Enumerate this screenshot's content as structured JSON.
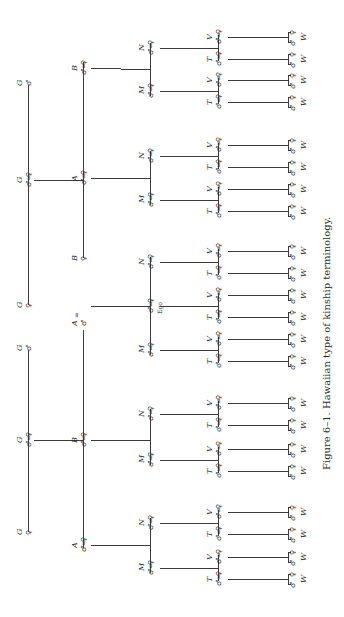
{
  "figure": {
    "caption": "Figure 6–1. Hawaiian type of kinship terminology.",
    "orientation": "rotated 90° clockwise",
    "symbols": {
      "male": "♂",
      "female": "♀",
      "married": "="
    },
    "ego_label": "Ego"
  },
  "generations": [
    {
      "level": "grandparents",
      "nodes": [
        {
          "label": "G",
          "sex": "male"
        },
        {
          "label": "G",
          "sex": "male",
          "spouse": {
            "label": "G",
            "sex": "female"
          }
        },
        {
          "label": "G",
          "sex": "female"
        },
        {
          "label": "G",
          "sex": "male"
        },
        {
          "label": "G",
          "sex": "male",
          "spouse": {
            "label": "G",
            "sex": "female"
          }
        },
        {
          "label": "G",
          "sex": "female"
        }
      ]
    },
    {
      "level": "parents",
      "nodes": [
        {
          "label": "B",
          "sex": "male",
          "spouse": {
            "label": "B",
            "sex": "female"
          }
        },
        {
          "label": "A",
          "sex": "male",
          "spouse": {
            "label": "A",
            "sex": "female"
          }
        },
        {
          "label": "B",
          "sex": "female"
        },
        {
          "label": "A",
          "sex": "male"
        },
        {
          "label": "B",
          "sex": "male",
          "spouse": {
            "label": "B",
            "sex": "female"
          }
        },
        {
          "label": "A",
          "sex": "male",
          "spouse": {
            "label": "A",
            "sex": "female"
          }
        }
      ]
    },
    {
      "level": "ego-generation",
      "labels": [
        "N",
        "M",
        "N",
        "M",
        "N",
        "Ego",
        "M",
        "N",
        "M",
        "N",
        "M"
      ]
    },
    {
      "level": "children",
      "labels": [
        "V",
        "T"
      ]
    },
    {
      "level": "grandchildren",
      "labels": [
        "W"
      ]
    }
  ]
}
